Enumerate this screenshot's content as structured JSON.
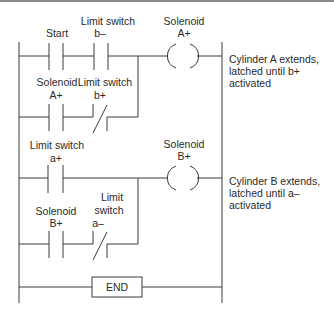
{
  "diagram": {
    "type": "ladder-logic",
    "rungs": [
      {
        "id": "rung-1",
        "contacts": [
          {
            "label": [
              "Start"
            ],
            "type": "NO"
          },
          {
            "label": [
              "Limit switch",
              "b–"
            ],
            "type": "NO"
          }
        ],
        "branch": [
          {
            "label": [
              "Solenoid",
              "A+"
            ],
            "type": "NO"
          },
          {
            "label": [
              "Limit switch",
              "b+"
            ],
            "type": "NC"
          }
        ],
        "coil": {
          "label": [
            "Solenoid",
            "A+"
          ]
        },
        "note": [
          "Cylinder A extends,",
          "latched until b+",
          "activated"
        ]
      },
      {
        "id": "rung-2",
        "contacts": [
          {
            "label": [
              "Limit switch",
              "a+"
            ],
            "type": "NO"
          }
        ],
        "branch": [
          {
            "label": [
              "Solenoid",
              "B+"
            ],
            "type": "NO"
          },
          {
            "label": [
              "Limit",
              "switch",
              "a–"
            ],
            "type": "NC"
          }
        ],
        "coil": {
          "label": [
            "Solenoid",
            "B+"
          ]
        },
        "note": [
          "Cylinder B extends,",
          "latched until a–",
          "activated"
        ]
      }
    ],
    "end_label": "END"
  }
}
